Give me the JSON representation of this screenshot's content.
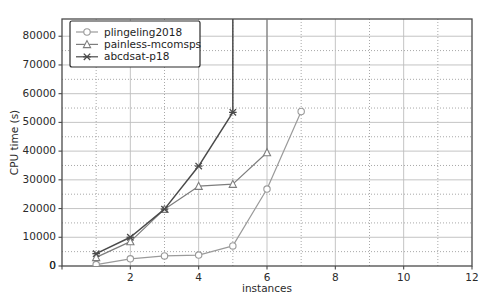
{
  "chart_data": {
    "type": "line",
    "title": "",
    "xlabel": "instances",
    "ylabel": "CPU time (s)",
    "xlim": [
      0,
      12
    ],
    "ylim": [
      0,
      86000
    ],
    "xticks": [
      0,
      2,
      4,
      6,
      8,
      10,
      12
    ],
    "xtick_labels": [
      "0",
      "2",
      "4",
      "6",
      "8",
      "10",
      "12"
    ],
    "yticks": [
      0,
      10000,
      20000,
      30000,
      40000,
      50000,
      60000,
      70000,
      80000
    ],
    "ytick_labels": [
      "0",
      "10000",
      "20000",
      "30000",
      "40000",
      "50000",
      "60000",
      "70000",
      "80000"
    ],
    "grid": true,
    "grid_major_axis": "both",
    "grid_minor": true,
    "legend_position": "upper left",
    "series": [
      {
        "name": "plingeling2018",
        "marker": "circle-open",
        "color": "#9a9a9a",
        "x": [
          1,
          2,
          3,
          4,
          5,
          6,
          7
        ],
        "y": [
          500,
          2500,
          3500,
          3800,
          7000,
          26800,
          53800
        ]
      },
      {
        "name": "painless-mcomsps",
        "marker": "triangle-open",
        "color": "#7d7d7d",
        "x": [
          1,
          2,
          3,
          4,
          5,
          6,
          6
        ],
        "y": [
          3000,
          8500,
          19800,
          27800,
          28500,
          39500,
          86000
        ]
      },
      {
        "name": "abcdsat-p18",
        "marker": "x",
        "color": "#4a4a4a",
        "x": [
          1,
          2,
          3,
          4,
          5,
          5
        ],
        "y": [
          4300,
          10000,
          19800,
          34800,
          53500,
          86000
        ]
      }
    ]
  },
  "legend": {
    "entries": [
      {
        "label": "plingeling2018"
      },
      {
        "label": "painless-mcomsps"
      },
      {
        "label": "abcdsat-p18"
      }
    ]
  },
  "colors": {
    "series1": "#9a9a9a",
    "series2": "#7d7d7d",
    "series3": "#4a4a4a",
    "grid_major": "#bdbdbd",
    "grid_minor": "#9e9e9e",
    "axis": "#4a4a4a",
    "text": "#2b2b2b",
    "background": "#ffffff"
  }
}
